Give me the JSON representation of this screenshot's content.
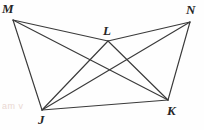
{
  "figure": {
    "width": 204,
    "height": 130,
    "background_color": "#fefefe",
    "line_color": "#3a3a3a",
    "label_color": "#262626",
    "vertices": [
      {
        "id": "M",
        "label": "M",
        "x": 13,
        "y": 20,
        "label_x": 2,
        "label_y": 2
      },
      {
        "id": "N",
        "label": "N",
        "x": 190,
        "y": 22,
        "label_x": 186,
        "label_y": 3
      },
      {
        "id": "L",
        "label": "L",
        "x": 108,
        "y": 41,
        "label_x": 103,
        "label_y": 24
      },
      {
        "id": "J",
        "label": "J",
        "x": 42,
        "y": 110,
        "label_x": 38,
        "label_y": 113
      },
      {
        "id": "K",
        "label": "K",
        "x": 168,
        "y": 100,
        "label_x": 167,
        "label_y": 104
      }
    ],
    "edges": [
      {
        "from": "M",
        "to": "L"
      },
      {
        "from": "L",
        "to": "N"
      },
      {
        "from": "M",
        "to": "J"
      },
      {
        "from": "N",
        "to": "K"
      },
      {
        "from": "J",
        "to": "K"
      },
      {
        "from": "M",
        "to": "K"
      },
      {
        "from": "N",
        "to": "J"
      },
      {
        "from": "L",
        "to": "J"
      },
      {
        "from": "L",
        "to": "K"
      }
    ],
    "watermark_text": "am v"
  }
}
